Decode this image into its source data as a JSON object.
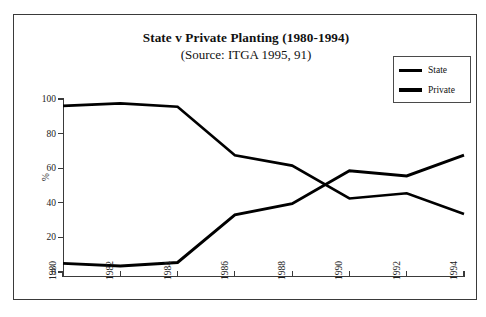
{
  "chart_data": {
    "type": "line",
    "title": "State v Private Planting (1980-1994)",
    "subtitle": "(Source: ITGA  1995, 91)",
    "xlabel": "",
    "ylabel": "%",
    "x": [
      1980,
      1982,
      1984,
      1986,
      1988,
      1990,
      1992,
      1994
    ],
    "categories": [
      "1980",
      "1982",
      "1984",
      "1986",
      "1988",
      "1990",
      "1992",
      "1994"
    ],
    "xlim": [
      1980,
      1994
    ],
    "ylim": [
      0,
      100
    ],
    "yticks": [
      0,
      20,
      40,
      60,
      80,
      100
    ],
    "ytick_labels": [
      "0",
      "20",
      "40",
      "60",
      "80",
      "100"
    ],
    "grid": false,
    "legend_position": "top-right",
    "series": [
      {
        "name": "State",
        "color": "#000000",
        "values": [
          96,
          97.5,
          95.5,
          67.5,
          61.5,
          42.5,
          45.5,
          33.5
        ]
      },
      {
        "name": "Private",
        "color": "#000000",
        "values": [
          5,
          3.5,
          5.5,
          33,
          39.5,
          58.5,
          55.5,
          67.5
        ]
      }
    ]
  },
  "legend": {
    "items": [
      {
        "label": "State"
      },
      {
        "label": "Private"
      }
    ]
  },
  "colors": {
    "line": "#000000",
    "axis": "#3a3a3a",
    "frame": "#3a3a3a",
    "text": "#111111"
  }
}
